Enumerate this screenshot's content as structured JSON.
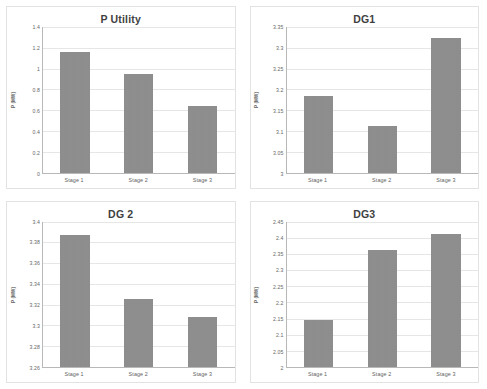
{
  "figure": {
    "layout": "2x2 grid of bar charts",
    "panel_count": 4
  },
  "chart_data": [
    {
      "type": "bar",
      "title": "P Utility",
      "categories": [
        "Stage 1",
        "Stage 2",
        "Stage 3"
      ],
      "values": [
        1.155,
        0.952,
        0.638
      ],
      "xlabel": "",
      "ylabel": "P (MW)",
      "ylim": [
        0,
        1.4
      ],
      "yticks": [
        "0",
        "0.2",
        "0.4",
        "0.6",
        "0.8",
        "1",
        "1.2",
        "1.4"
      ],
      "ytick_values": [
        0,
        0.2,
        0.4,
        0.6,
        0.8,
        1.0,
        1.2,
        1.4
      ],
      "grid": true,
      "legend": "none",
      "bar_color": "#8e8e8e"
    },
    {
      "type": "bar",
      "title": "DG1",
      "categories": [
        "Stage 1",
        "Stage 2",
        "Stage 3"
      ],
      "values": [
        3.185,
        3.113,
        3.323
      ],
      "xlabel": "",
      "ylabel": "P (MW)",
      "ylim": [
        3,
        3.35
      ],
      "yticks": [
        "3",
        "3.05",
        "3.1",
        "3.15",
        "3.2",
        "3.25",
        "3.3",
        "3.35"
      ],
      "ytick_values": [
        3,
        3.05,
        3.1,
        3.15,
        3.2,
        3.25,
        3.3,
        3.35
      ],
      "grid": true,
      "legend": "none",
      "bar_color": "#8e8e8e"
    },
    {
      "type": "bar",
      "title": "DG 2",
      "categories": [
        "Stage 1",
        "Stage 2",
        "Stage 3"
      ],
      "values": [
        3.387,
        3.325,
        3.308
      ],
      "xlabel": "",
      "ylabel": "P (MW)",
      "ylim": [
        3.26,
        3.4
      ],
      "yticks": [
        "3.26",
        "3.28",
        "3.3",
        "3.32",
        "3.34",
        "3.36",
        "3.38",
        "3.4"
      ],
      "ytick_values": [
        3.26,
        3.28,
        3.3,
        3.32,
        3.34,
        3.36,
        3.38,
        3.4
      ],
      "grid": true,
      "legend": "none",
      "bar_color": "#8e8e8e"
    },
    {
      "type": "bar",
      "title": "DG3",
      "categories": [
        "Stage 1",
        "Stage 2",
        "Stage 3"
      ],
      "values": [
        2.145,
        2.362,
        2.412
      ],
      "xlabel": "",
      "ylabel": "P (MW)",
      "ylim": [
        2,
        2.45
      ],
      "yticks": [
        "2",
        "2.05",
        "2.1",
        "2.15",
        "2.2",
        "2.25",
        "2.3",
        "2.35",
        "2.4",
        "2.45"
      ],
      "ytick_values": [
        2,
        2.05,
        2.1,
        2.15,
        2.2,
        2.25,
        2.3,
        2.35,
        2.4,
        2.45
      ],
      "grid": true,
      "legend": "none",
      "bar_color": "#8e8e8e"
    }
  ]
}
